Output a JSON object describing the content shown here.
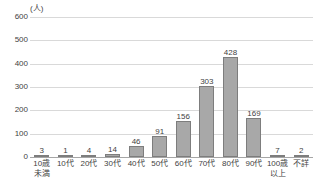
{
  "chart_data": {
    "type": "bar",
    "title": "",
    "subtitle": "",
    "xlabel": "",
    "ylabel": "",
    "unit_label": "(人)",
    "ylim": [
      0,
      600
    ],
    "ytick_step": 100,
    "yticks": [
      "600",
      "500",
      "400",
      "300",
      "200",
      "100",
      "0"
    ],
    "grid": true,
    "legend": null,
    "legend_position": "none",
    "bar_color": "#a8a8a8",
    "bar_border_color": "#7d7d7d",
    "gridline_color": "#d9d9d9",
    "axis_color": "#a6a6a6",
    "text_color": "#3f3f3f",
    "categories": [
      "10歳未満",
      "10代",
      "20代",
      "30代",
      "40代",
      "50代",
      "60代",
      "70代",
      "80代",
      "90代",
      "100歳以上",
      "不詳"
    ],
    "category_lines": [
      [
        "10歳",
        "未満"
      ],
      [
        "10代"
      ],
      [
        "20代"
      ],
      [
        "30代"
      ],
      [
        "40代"
      ],
      [
        "50代"
      ],
      [
        "60代"
      ],
      [
        "70代"
      ],
      [
        "80代"
      ],
      [
        "90代"
      ],
      [
        "100歳",
        "以上"
      ],
      [
        "不詳"
      ]
    ],
    "values": [
      3,
      1,
      4,
      14,
      46,
      91,
      156,
      303,
      428,
      169,
      7,
      2
    ],
    "value_labels": [
      "3",
      "1",
      "4",
      "14",
      "46",
      "91",
      "156",
      "303",
      "428",
      "169",
      "7",
      "2"
    ]
  }
}
